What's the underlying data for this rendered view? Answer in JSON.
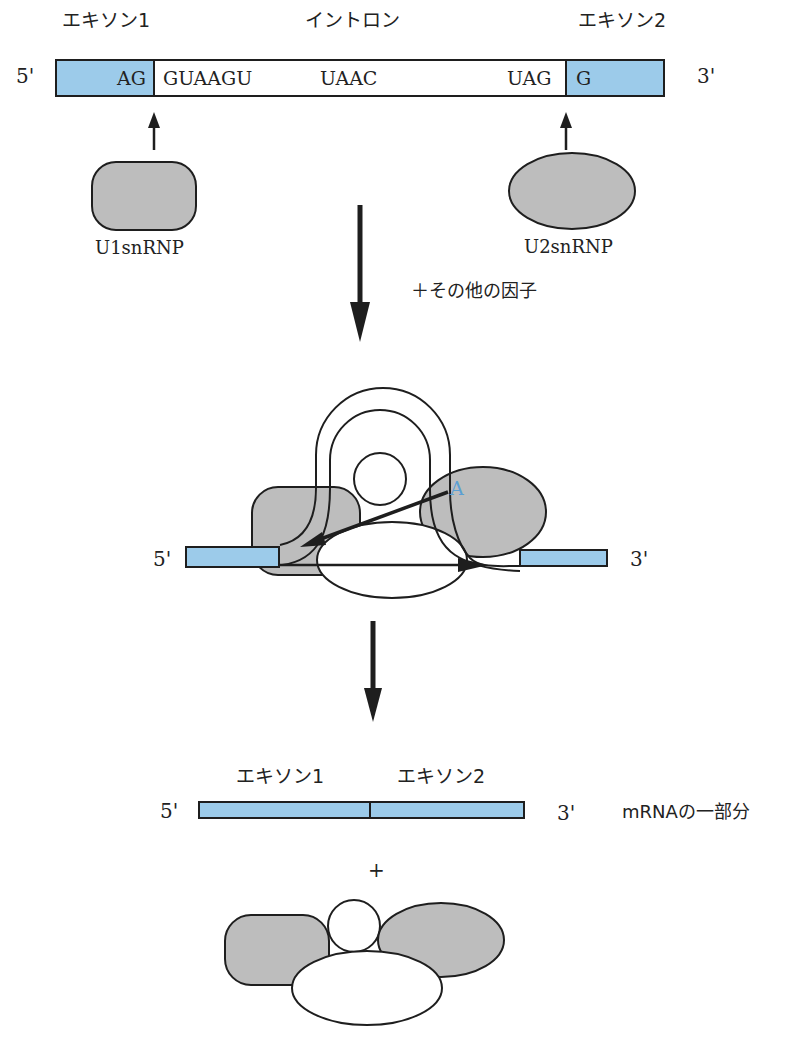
{
  "colors": {
    "exon_fill": "#9ccbea",
    "protein_fill": "#bdbdbd",
    "stroke": "#1e1e1e",
    "branch_point": "#5a9fd4"
  },
  "step1": {
    "exon1_label": "エキソン1",
    "intron_label": "イントロン",
    "exon2_label": "エキソン2",
    "five_prime": "5'",
    "three_prime": "3'",
    "seq_exon1_end": "AG",
    "seq_5ss": "GUAAGU",
    "seq_branch": "UAAC",
    "seq_3ss": "UAG",
    "seq_exon2_start": "G",
    "u1_label": "U1snRNP",
    "u2_label": "U2snRNP"
  },
  "arrow1": {
    "label": "＋その他の因子"
  },
  "step2": {
    "five_prime": "5'",
    "three_prime": "3'",
    "branch_point": "A"
  },
  "step3": {
    "exon1_label": "エキソン1",
    "exon2_label": "エキソン2",
    "five_prime": "5'",
    "three_prime": "3'",
    "mrna_label": "mRNAの一部分",
    "plus": "+"
  }
}
